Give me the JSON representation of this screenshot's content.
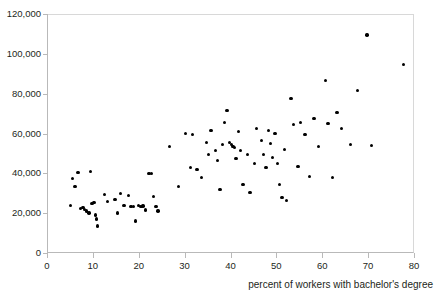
{
  "chart_data": {
    "type": "scatter",
    "title": "",
    "xlabel": "percent of workers with bachelor's degree",
    "ylabel": "",
    "xlim": [
      0,
      80
    ],
    "ylim": [
      0,
      120000
    ],
    "xticks": [
      0,
      10,
      20,
      30,
      40,
      50,
      60,
      70,
      80
    ],
    "xtick_labels": [
      "0",
      "10",
      "20",
      "30",
      "40",
      "50",
      "60",
      "70",
      "80"
    ],
    "yticks": [
      0,
      20000,
      40000,
      60000,
      80000,
      100000,
      120000
    ],
    "ytick_labels": [
      "0",
      "20,000",
      "40,000",
      "60,000",
      "80,000",
      "100,000",
      "120,000"
    ],
    "grid": false,
    "legend": null,
    "marker": "filled-circle",
    "marker_color": "#000000",
    "points": [
      [
        5.4,
        38000
      ],
      [
        5.9,
        34000
      ],
      [
        4.9,
        24500
      ],
      [
        6.5,
        41000
      ],
      [
        7.1,
        23000
      ],
      [
        7.6,
        23500
      ],
      [
        8.0,
        22500
      ],
      [
        8.4,
        21500
      ],
      [
        8.9,
        20500
      ],
      [
        9.2,
        41500
      ],
      [
        9.6,
        25500
      ],
      [
        10.0,
        26000
      ],
      [
        10.4,
        19500
      ],
      [
        10.6,
        17500
      ],
      [
        10.8,
        14000
      ],
      [
        12.3,
        30000
      ],
      [
        13.0,
        26500
      ],
      [
        14.6,
        27500
      ],
      [
        15.2,
        20500
      ],
      [
        15.8,
        30500
      ],
      [
        16.6,
        24500
      ],
      [
        17.6,
        29500
      ],
      [
        18.1,
        24000
      ],
      [
        18.6,
        24000
      ],
      [
        19.1,
        16500
      ],
      [
        19.7,
        24500
      ],
      [
        20.3,
        24000
      ],
      [
        20.7,
        24200
      ],
      [
        21.3,
        22000
      ],
      [
        22.0,
        40500
      ],
      [
        22.6,
        40500
      ],
      [
        23.0,
        29000
      ],
      [
        23.5,
        24000
      ],
      [
        24.0,
        21500
      ],
      [
        26.5,
        54000
      ],
      [
        28.5,
        34000
      ],
      [
        30.0,
        60500
      ],
      [
        31.0,
        43500
      ],
      [
        31.5,
        60000
      ],
      [
        32.5,
        42500
      ],
      [
        33.5,
        38500
      ],
      [
        34.5,
        56000
      ],
      [
        35.0,
        50000
      ],
      [
        35.5,
        62000
      ],
      [
        36.5,
        52000
      ],
      [
        37.0,
        47000
      ],
      [
        37.5,
        32500
      ],
      [
        38.0,
        55000
      ],
      [
        38.5,
        66000
      ],
      [
        39.0,
        72000
      ],
      [
        39.5,
        56000
      ],
      [
        40.0,
        55000
      ],
      [
        40.3,
        54000
      ],
      [
        40.6,
        53500
      ],
      [
        41.0,
        48000
      ],
      [
        41.5,
        61500
      ],
      [
        42.0,
        52000
      ],
      [
        42.5,
        35000
      ],
      [
        43.5,
        50000
      ],
      [
        44.0,
        31000
      ],
      [
        45.0,
        45500
      ],
      [
        45.5,
        63000
      ],
      [
        46.5,
        57000
      ],
      [
        47.0,
        50000
      ],
      [
        47.5,
        43500
      ],
      [
        48.0,
        62000
      ],
      [
        48.5,
        55500
      ],
      [
        49.0,
        48500
      ],
      [
        49.5,
        60500
      ],
      [
        50.0,
        45500
      ],
      [
        50.5,
        35000
      ],
      [
        51.0,
        28500
      ],
      [
        51.5,
        52500
      ],
      [
        52.0,
        27000
      ],
      [
        53.0,
        78000
      ],
      [
        53.5,
        65000
      ],
      [
        54.5,
        44000
      ],
      [
        55.0,
        66000
      ],
      [
        56.0,
        60000
      ],
      [
        57.0,
        39000
      ],
      [
        58.0,
        68000
      ],
      [
        59.0,
        54000
      ],
      [
        60.5,
        87000
      ],
      [
        61.0,
        65500
      ],
      [
        62.0,
        38500
      ],
      [
        63.0,
        71000
      ],
      [
        64.0,
        63000
      ],
      [
        66.0,
        55000
      ],
      [
        67.5,
        82000
      ],
      [
        69.5,
        110000
      ],
      [
        70.5,
        54500
      ],
      [
        77.5,
        95000
      ]
    ]
  }
}
